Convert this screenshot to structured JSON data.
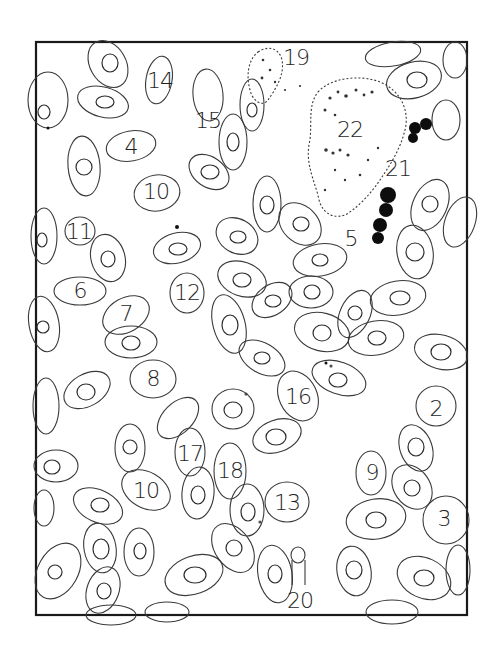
{
  "figure": {
    "frame": {
      "x": 36,
      "y": 42,
      "width": 431,
      "height": 573
    },
    "labels": [
      {
        "text": "14",
        "x": 160,
        "y": 80
      },
      {
        "text": "15",
        "x": 208,
        "y": 120
      },
      {
        "text": "4",
        "x": 131,
        "y": 146
      },
      {
        "text": "10",
        "x": 156,
        "y": 191
      },
      {
        "text": "11",
        "x": 79,
        "y": 231
      },
      {
        "text": "6",
        "x": 80,
        "y": 290
      },
      {
        "text": "7",
        "x": 126,
        "y": 313
      },
      {
        "text": "12",
        "x": 187,
        "y": 292
      },
      {
        "text": "8",
        "x": 153,
        "y": 378
      },
      {
        "text": "19",
        "x": 296,
        "y": 57
      },
      {
        "text": "22",
        "x": 350,
        "y": 129
      },
      {
        "text": "21",
        "x": 398,
        "y": 168
      },
      {
        "text": "5",
        "x": 351,
        "y": 238
      },
      {
        "text": "16",
        "x": 298,
        "y": 396
      },
      {
        "text": "2",
        "x": 436,
        "y": 408
      },
      {
        "text": "17",
        "x": 190,
        "y": 453
      },
      {
        "text": "18",
        "x": 230,
        "y": 470
      },
      {
        "text": "10",
        "x": 146,
        "y": 490
      },
      {
        "text": "13",
        "x": 287,
        "y": 502
      },
      {
        "text": "9",
        "x": 372,
        "y": 472
      },
      {
        "text": "3",
        "x": 444,
        "y": 518
      },
      {
        "text": "20",
        "x": 300,
        "y": 600
      }
    ],
    "colors": {
      "ink": "#2c2c2c",
      "paper": "#ffffff",
      "granules": "#0d0d0d"
    }
  }
}
